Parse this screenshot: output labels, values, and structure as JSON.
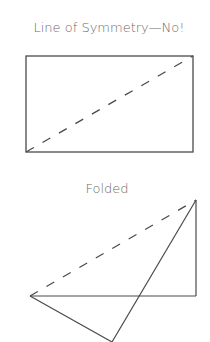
{
  "diagram1": {
    "title": "Line of Symmetry—No!",
    "shape": "rectangle",
    "rect": {
      "x1": 26,
      "y1": 56,
      "x2": 193,
      "y2": 152
    },
    "dashed_diagonal": {
      "from": [
        26,
        152
      ],
      "to": [
        193,
        56
      ]
    }
  },
  "diagram2": {
    "title": "Folded",
    "points": {
      "left": [
        30,
        296
      ],
      "top_right": [
        196,
        200
      ],
      "bottom_right": [
        196,
        296
      ],
      "bottom": [
        112,
        342
      ]
    },
    "dashed_edge": {
      "from": [
        30,
        296
      ],
      "to": [
        196,
        200
      ]
    }
  },
  "colors": {
    "stroke": "#4a4a4a",
    "text": "#6b6b6b"
  }
}
